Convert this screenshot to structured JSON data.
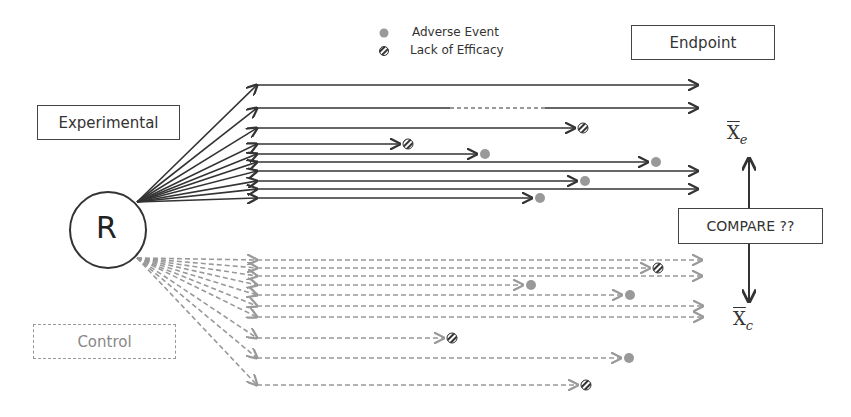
{
  "legend": {
    "adverse_event": "Adverse Event",
    "lack_of_efficacy": "Lack of Efficacy"
  },
  "labels": {
    "endpoint": "Endpoint",
    "experimental": "Experimental",
    "control": "Control",
    "randomization": "R",
    "compare": "COMPARE ??",
    "xbar_e_base": "X",
    "xbar_e_sub": "e",
    "xbar_c_base": "X",
    "xbar_c_sub": "c"
  },
  "colors": {
    "experimental_line": "#333333",
    "control_line": "#999999",
    "adverse_event_marker": "#999999",
    "lack_of_efficacy_marker": "#333333"
  },
  "experimental_arms": [
    {
      "y": 85,
      "end": 698,
      "outcome": "endpoint"
    },
    {
      "y": 108,
      "end": 698,
      "outcome": "endpoint",
      "gap": [
        450,
        545
      ]
    },
    {
      "y": 128,
      "end": 575,
      "outcome": "lack_of_efficacy"
    },
    {
      "y": 144,
      "end": 400,
      "outcome": "lack_of_efficacy"
    },
    {
      "y": 154,
      "end": 477,
      "outcome": "adverse_event"
    },
    {
      "y": 162,
      "end": 648,
      "outcome": "adverse_event"
    },
    {
      "y": 171,
      "end": 698,
      "outcome": "endpoint"
    },
    {
      "y": 181,
      "end": 577,
      "outcome": "adverse_event"
    },
    {
      "y": 189,
      "end": 698,
      "outcome": "endpoint"
    },
    {
      "y": 198,
      "end": 532,
      "outcome": "adverse_event"
    }
  ],
  "control_arms": [
    {
      "y": 260,
      "end": 702,
      "outcome": "endpoint"
    },
    {
      "y": 268,
      "end": 650,
      "outcome": "lack_of_efficacy"
    },
    {
      "y": 276,
      "end": 702,
      "outcome": "endpoint"
    },
    {
      "y": 285,
      "end": 523,
      "outcome": "adverse_event"
    },
    {
      "y": 295,
      "end": 622,
      "outcome": "adverse_event"
    },
    {
      "y": 306,
      "end": 703,
      "outcome": "endpoint"
    },
    {
      "y": 317,
      "end": 703,
      "outcome": "endpoint"
    },
    {
      "y": 338,
      "end": 444,
      "outcome": "lack_of_efficacy"
    },
    {
      "y": 358,
      "end": 621,
      "outcome": "adverse_event"
    },
    {
      "y": 385,
      "end": 578,
      "outcome": "lack_of_efficacy"
    }
  ]
}
